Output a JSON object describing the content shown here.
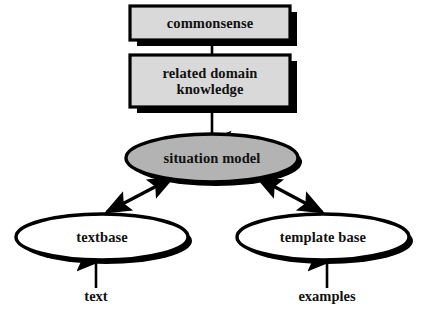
{
  "diagram": {
    "background_color": "#ffffff",
    "stroke_color": "#000000",
    "box_fill_color": "#d9d9d9",
    "ellipse_fill_gray": "#b3b3b3",
    "ellipse_fill_white": "#ffffff",
    "shadow_color": "#000000",
    "nodes": [
      {
        "id": "commonsense",
        "label": "commonsense",
        "shape": "box",
        "fill": "#d9d9d9"
      },
      {
        "id": "related-domain-knowledge",
        "label": "related domain\nknowledge",
        "shape": "box",
        "fill": "#d9d9d9"
      },
      {
        "id": "situation-model",
        "label": "situation model",
        "shape": "ellipse",
        "fill": "#b3b3b3"
      },
      {
        "id": "textbase",
        "label": "textbase",
        "shape": "ellipse",
        "fill": "#ffffff"
      },
      {
        "id": "template-base",
        "label": "template base",
        "shape": "ellipse",
        "fill": "#ffffff"
      }
    ],
    "free_labels": [
      {
        "id": "text",
        "label": "text"
      },
      {
        "id": "examples",
        "label": "examples"
      }
    ],
    "edges": [
      {
        "id": "commonsense-to-knowledge",
        "from": "commonsense",
        "to": "related-domain-knowledge",
        "arrowheads": "none"
      },
      {
        "id": "knowledge-to-situation-model",
        "from": "related-domain-knowledge",
        "to": "situation-model",
        "arrowheads": "end"
      },
      {
        "id": "situation-model-to-textbase",
        "from": "situation-model",
        "to": "textbase",
        "arrowheads": "both"
      },
      {
        "id": "situation-model-to-template-base",
        "from": "situation-model",
        "to": "template-base",
        "arrowheads": "both"
      },
      {
        "id": "text-to-textbase",
        "from": "text",
        "to": "textbase",
        "arrowheads": "end"
      },
      {
        "id": "examples-to-template-base",
        "from": "examples",
        "to": "template-base",
        "arrowheads": "end"
      }
    ]
  }
}
